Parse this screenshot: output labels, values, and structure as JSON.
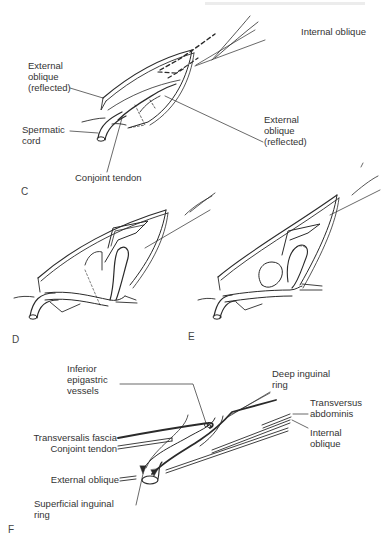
{
  "figure": {
    "panels": [
      {
        "id": "C",
        "letter": "C",
        "labels": {
          "internal_oblique": "Internal oblique",
          "external_oblique_left_l1": "External",
          "external_oblique_left_l2": "oblique",
          "external_oblique_left_l3": "(reflected)",
          "spermatic_cord_l1": "Spermatic",
          "spermatic_cord_l2": "cord",
          "external_oblique_right_l1": "External",
          "external_oblique_right_l2": "oblique",
          "external_oblique_right_l3": "(reflected)",
          "conjoint_tendon": "Conjoint tendon"
        }
      },
      {
        "id": "D",
        "letter": "D"
      },
      {
        "id": "E",
        "letter": "E"
      },
      {
        "id": "F",
        "letter": "F",
        "labels": {
          "inferior_epigastric_l1": "Inferior",
          "inferior_epigastric_l2": "epigastric",
          "inferior_epigastric_l3": "vessels",
          "deep_inguinal_ring_l1": "Deep inguinal",
          "deep_inguinal_ring_l2": "ring",
          "transversus_abdominis_l1": "Transversus",
          "transversus_abdominis_l2": "abdominis",
          "transversalis_fascia": "Transversalis fascia",
          "conjoint_tendon": "Conjoint tendon",
          "internal_oblique_l1": "Internal",
          "internal_oblique_l2": "oblique",
          "external_oblique": "External oblique",
          "superficial_inguinal_ring_l1": "Superficial inguinal",
          "superficial_inguinal_ring_l2": "ring"
        }
      }
    ]
  },
  "colors": {
    "ink": "#2a2a2a",
    "background": "#ffffff"
  }
}
